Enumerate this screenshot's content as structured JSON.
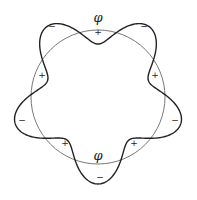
{
  "diagram": {
    "circle": {
      "cx": 98,
      "cy": 97,
      "r": 67,
      "stroke": "#777777"
    },
    "wave": {
      "base_r": 70,
      "amplitude": 17,
      "lobes": 5,
      "phase_deg": 90,
      "stroke": "#222222"
    },
    "phi_labels": [
      {
        "text": "φ",
        "x": 98,
        "y": 22
      },
      {
        "text": "φ",
        "x": 98,
        "y": 160
      }
    ],
    "signs": [
      {
        "text": "−",
        "x": 52,
        "y": 29
      },
      {
        "text": "+",
        "x": 98,
        "y": 35
      },
      {
        "text": "−",
        "x": 144,
        "y": 29
      },
      {
        "text": "+",
        "x": 42,
        "y": 78
      },
      {
        "text": "+",
        "x": 155,
        "y": 78
      },
      {
        "text": "−",
        "x": 22,
        "y": 123
      },
      {
        "text": "−",
        "x": 175,
        "y": 123
      },
      {
        "text": "+",
        "x": 65,
        "y": 146
      },
      {
        "text": "+",
        "x": 134,
        "y": 146
      },
      {
        "text": "−",
        "x": 100,
        "y": 180
      }
    ]
  }
}
